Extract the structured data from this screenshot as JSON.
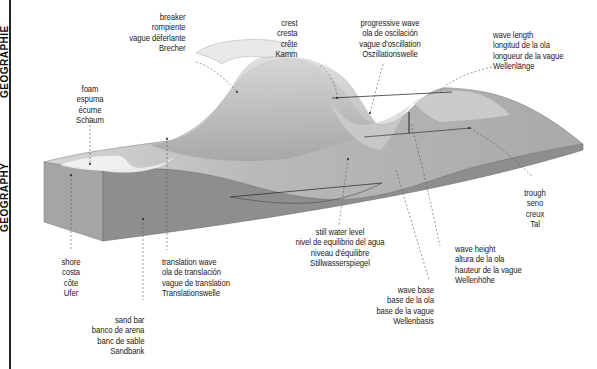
{
  "sidebar": {
    "text_top": "GEOGRAPHIE",
    "text_bottom": "GEOGRAPHY"
  },
  "diagram": {
    "colors": {
      "water_light": "#c9c9c9",
      "water_mid": "#a8a8a8",
      "seabed_front": "#8f8f8f",
      "seabed_side": "#9a9a9a",
      "foam": "#f2f2f2",
      "leader": "#555555"
    },
    "labels": {
      "breaker": [
        "breaker",
        "rompiente",
        "vague déferlante",
        "Brecher"
      ],
      "crest": [
        "crest",
        "cresta",
        "crête",
        "Kamm"
      ],
      "progressive_wave": [
        "progressive wave",
        "ola de oscilación",
        "vague d'oscillation",
        "Oszillationswelle"
      ],
      "wave_length": [
        "wave length",
        "longitud de la ola",
        "longueur de la vague",
        "Wellenlänge"
      ],
      "foam": [
        "foam",
        "espuma",
        "écume",
        "Schaum"
      ],
      "trough": [
        "trough",
        "seno",
        "creux",
        "Tal"
      ],
      "still_water_level": [
        "still water level",
        "nivel de equilibrio del agua",
        "niveau d'équilibre",
        "Stillwasserspiegel"
      ],
      "wave_height": [
        "wave height",
        "altura de la ola",
        "hauteur de la vague",
        "Wellenhöhe"
      ],
      "wave_base": [
        "wave base",
        "base de la ola",
        "base de la vague",
        "Wellenbasis"
      ],
      "shore": [
        "shore",
        "costa",
        "côte",
        "Ufer"
      ],
      "translation_wave": [
        "translation wave",
        "ola de translación",
        "vague de translation",
        "Translationswelle"
      ],
      "sand_bar": [
        "sand bar",
        "banco de arena",
        "banc de sable",
        "Sandbank"
      ]
    }
  }
}
